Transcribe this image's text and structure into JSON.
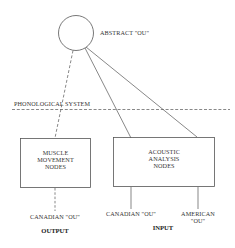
{
  "diagram": {
    "abstract_node": {
      "label": "ABSTRACT \"OU\""
    },
    "boundary": {
      "label": "PHONOLOGICAL SYSTEM"
    },
    "muscle_box": {
      "line1": "MUSCLE",
      "line2": "MOVEMENT",
      "line3": "NODES"
    },
    "acoustic_box": {
      "line1": "ACOUSTIC",
      "line2": "ANALYSIS",
      "line3": "NODES"
    },
    "output": {
      "item": "CANADIAN \"OU\"",
      "heading": "OUTPUT"
    },
    "input": {
      "items": [
        {
          "line1": "CANADIAN \"OU\""
        },
        {
          "line1": "AMERICAN",
          "line2": "\"OU\""
        }
      ],
      "heading": "INPUT"
    },
    "colors": {
      "stroke": "#555555",
      "text": "#333333",
      "background": "#ffffff"
    }
  }
}
